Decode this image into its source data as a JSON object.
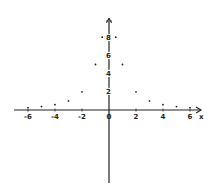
{
  "chart_data": {
    "type": "scatter",
    "title": "",
    "xlabel": "x",
    "ylabel": "",
    "xlim": [
      -7,
      7
    ],
    "ylim": [
      -8,
      10
    ],
    "grid": false,
    "legend": null,
    "x_ticks": [
      -6,
      -4,
      -2,
      0,
      2,
      4,
      6
    ],
    "x_tick_labels": [
      "-6",
      "-4",
      "-2",
      "0",
      "2",
      "4",
      "6"
    ],
    "y_ticks": [
      2,
      4,
      6,
      8
    ],
    "y_tick_labels": [
      "2",
      "4",
      "6",
      "8"
    ],
    "series": [
      {
        "name": "points",
        "x": [
          -6,
          -5,
          -4,
          -3,
          -2,
          -1,
          -0.5,
          0,
          0.5,
          1,
          2,
          3,
          4,
          5,
          6
        ],
        "y": [
          0.27,
          0.38,
          0.59,
          1,
          2,
          5,
          8,
          10,
          8,
          5,
          2,
          1,
          0.59,
          0.38,
          0.27
        ]
      }
    ],
    "style": "hand-drawn axes with arrowheads, dotted points"
  },
  "colors": {
    "ink": "#222222",
    "background": "#ffffff"
  }
}
